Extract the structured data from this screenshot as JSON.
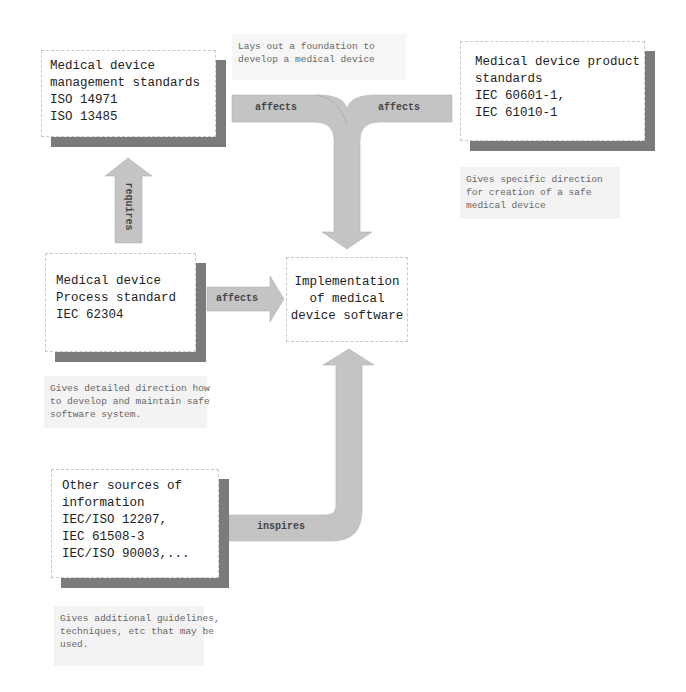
{
  "diagram": {
    "colors": {
      "box_border": "#c8c8c8",
      "box_shadow": "#7b7b7b",
      "arrow_fill": "#c4c4c4",
      "note_bg": "#f3f3f3",
      "note_text": "#666666",
      "box_text": "#222222"
    },
    "boxes": {
      "management": {
        "lines": [
          "Medical device",
          "management standards",
          "ISO 14971",
          "ISO 13485"
        ]
      },
      "product": {
        "lines": [
          "Medical device product",
          "standards",
          "IEC 60601-1,",
          "IEC 61010-1"
        ]
      },
      "process": {
        "lines": [
          "Medical device",
          "Process standard",
          "IEC 62304"
        ]
      },
      "implementation": {
        "lines": [
          "Implementation",
          "of medical",
          "device software"
        ]
      },
      "other": {
        "lines": [
          "Other sources of",
          "information",
          "IEC/ISO 12207,",
          "IEC 61508-3",
          "IEC/ISO 90003,..."
        ]
      }
    },
    "notes": {
      "foundation": {
        "lines": [
          "Lays out a foundation to",
          "develop a medical device"
        ]
      },
      "product": {
        "lines": [
          "Gives specific direction",
          "for creation of a safe",
          "medical device"
        ]
      },
      "process": {
        "lines": [
          "Gives detailed direction how",
          "to develop and maintain safe",
          "software system."
        ]
      },
      "other": {
        "lines": [
          "Gives additional guidelines,",
          "techniques, etc that may be",
          "used."
        ]
      }
    },
    "arrows": {
      "requires": {
        "label": "requires",
        "from": "process",
        "to": "management"
      },
      "affects_left": {
        "label": "affects",
        "from": "management",
        "to": "implementation"
      },
      "affects_right": {
        "label": "affects",
        "from": "product",
        "to": "implementation"
      },
      "affects_process": {
        "label": "affects",
        "from": "process",
        "to": "implementation"
      },
      "inspires": {
        "label": "inspires",
        "from": "other",
        "to": "implementation"
      }
    }
  }
}
